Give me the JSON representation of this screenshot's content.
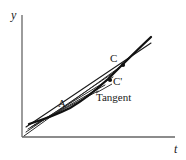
{
  "figure": {
    "type": "calculus-tangent-secant-diagram",
    "background_color": "#ffffff",
    "ink_color": "#1a1a1a",
    "axes": {
      "color": "#555555",
      "y_axis_label": "y",
      "x_axis_label": "t",
      "y_axis": {
        "x": 22,
        "y_top": 15,
        "y_bottom": 137
      },
      "x_axis": {
        "y": 137,
        "x_left": 22,
        "x_right": 175
      },
      "ticks": false,
      "grid": false
    },
    "labels": {
      "point_A": "A",
      "point_C": "C",
      "point_C_prime": "C'",
      "tangent_line": "Tangent"
    },
    "points": [
      {
        "name": "A",
        "x": 66,
        "y": 110,
        "marker": false
      },
      {
        "name": "C",
        "x": 123,
        "y": 65,
        "marker": true
      },
      {
        "name": "C'",
        "x": 111,
        "y": 79,
        "marker": true
      }
    ],
    "curve": {
      "name": "function-curve",
      "description": "increasing convex curve from lower-left to upper-right",
      "stroke_width": 2.2,
      "path_points": [
        [
          30,
          123
        ],
        [
          45,
          117
        ],
        [
          58,
          113
        ],
        [
          70,
          108
        ],
        [
          84,
          100
        ],
        [
          96,
          91
        ],
        [
          108,
          80
        ],
        [
          120,
          67
        ],
        [
          132,
          54
        ],
        [
          143,
          44
        ],
        [
          151,
          37
        ]
      ]
    },
    "tangent_line": {
      "name": "tangent-at-A",
      "stroke_width": 1.2,
      "from": [
        27,
        125
      ],
      "to": [
        150,
        44
      ]
    },
    "secant_lines": [
      {
        "name": "secant-1",
        "from": [
          24,
          135
        ],
        "to": [
          123,
          65
        ]
      },
      {
        "name": "secant-2",
        "from": [
          26,
          131
        ],
        "to": [
          119,
          69
        ]
      },
      {
        "name": "secant-3",
        "from": [
          29,
          128
        ],
        "to": [
          113,
          77
        ]
      },
      {
        "name": "secant-4",
        "from": [
          32,
          126
        ],
        "to": [
          104,
          86
        ]
      },
      {
        "name": "secant-5",
        "from": [
          35,
          124
        ],
        "to": [
          97,
          92
        ]
      }
    ],
    "tangent_leader": {
      "name": "tangent-leader-line",
      "from": [
        97,
        93
      ],
      "to": [
        112,
        84
      ]
    }
  }
}
